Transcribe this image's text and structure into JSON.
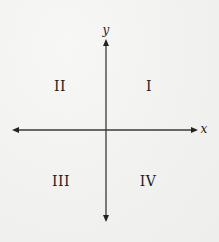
{
  "diagram": {
    "axes": {
      "x_label": "x",
      "y_label": "y",
      "color": "#222222"
    },
    "quadrants": [
      {
        "id": "I",
        "label": "I"
      },
      {
        "id": "II",
        "label": "II"
      },
      {
        "id": "III",
        "label": "III"
      },
      {
        "id": "IV",
        "label": "IV"
      }
    ]
  }
}
